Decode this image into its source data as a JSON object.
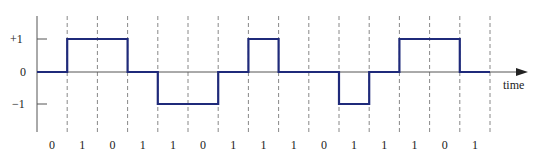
{
  "chart_data": {
    "type": "line",
    "title": "",
    "xlabel": "time",
    "ylabel": "",
    "y_ticks": [
      "+1",
      "0",
      "−1"
    ],
    "y_values": [
      1,
      0,
      -1
    ],
    "bits": [
      "0",
      "1",
      "0",
      "1",
      "1",
      "0",
      "1",
      "1",
      "1",
      "0",
      "1",
      "1",
      "1",
      "0",
      "1"
    ],
    "levels": [
      0,
      1,
      1,
      0,
      -1,
      -1,
      0,
      1,
      0,
      0,
      -1,
      0,
      1,
      1,
      0
    ],
    "colors": {
      "signal": "#1f2a7a",
      "axis": "#555555",
      "grid": "#888888"
    }
  },
  "labels": {
    "time": "time",
    "plus_one": "+1",
    "zero": "0",
    "minus_one": "−1"
  }
}
